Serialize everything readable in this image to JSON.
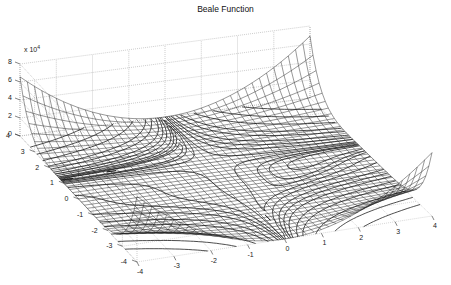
{
  "chart_data": {
    "type": "surface",
    "subtype": "mesh with contour (meshc)",
    "title": "Beale Function",
    "function": "f(x,y) = (1.5 - x + x*y)^2 + (2.25 - x + x*y^2)^2 + (2.625 - x + x*y^3)^2",
    "xlabel": "",
    "ylabel": "",
    "zlabel": "",
    "x_range": [
      -4,
      4
    ],
    "y_range": [
      -4,
      4
    ],
    "z_range": [
      0,
      80000
    ],
    "z_scale_label": "x 10",
    "z_scale_exponent": "4",
    "x_ticks": [
      -4,
      -3,
      -2,
      -1,
      0,
      1,
      2,
      3,
      4
    ],
    "y_ticks": [
      -4,
      -3,
      -2,
      -1,
      0,
      1,
      2,
      3,
      4
    ],
    "z_ticks": [
      0,
      2,
      4,
      6,
      8
    ],
    "grid": true,
    "z_clipped_at": 80000,
    "mesh_color": "#1a1a1a",
    "contour_color": "#000000",
    "grid_color": "#9a9a9a"
  },
  "labels": {
    "title": "Beale Function",
    "z_scale": "x 10",
    "z_scale_exp": "4"
  }
}
